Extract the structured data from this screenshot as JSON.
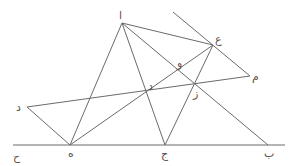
{
  "diagram": {
    "type": "geometric-figure",
    "colors": {
      "line": "#6b6b6b",
      "label": "#555555",
      "background": "#ffffff"
    },
    "points": [
      {
        "id": "alif",
        "label": "ا",
        "x": 122,
        "y": 23,
        "lx": 119,
        "ly": 19
      },
      {
        "id": "ayn",
        "label": "ع",
        "x": 213,
        "y": 45,
        "lx": 215,
        "ly": 43
      },
      {
        "id": "mim",
        "label": "م",
        "x": 250,
        "y": 76,
        "lx": 252,
        "ly": 80
      },
      {
        "id": "dal-left",
        "label": "د",
        "x": 27,
        "y": 107,
        "lx": 16,
        "ly": 111
      },
      {
        "id": "ha",
        "label": "ه",
        "x": 70,
        "y": 145,
        "lx": 68,
        "ly": 157
      },
      {
        "id": "jim",
        "label": "ج",
        "x": 165,
        "y": 145,
        "lx": 161,
        "ly": 158
      },
      {
        "id": "ba",
        "label": "ب",
        "x": 268,
        "y": 145,
        "lx": 264,
        "ly": 157
      },
      {
        "id": "ha-jim",
        "label": "ح",
        "x": 13,
        "y": 145,
        "lx": 13,
        "ly": 160
      },
      {
        "id": "dal-center",
        "label": "د",
        "x": 146,
        "y": 92,
        "lx": 148,
        "ly": 90
      },
      {
        "id": "waw",
        "label": "و",
        "x": 178,
        "y": 70,
        "lx": 177,
        "ly": 67
      },
      {
        "id": "zay",
        "label": "ز",
        "x": 196,
        "y": 84,
        "lx": 193,
        "ly": 97
      }
    ],
    "lines": [
      {
        "id": "baseline",
        "x1": 13,
        "y1": 145,
        "x2": 285,
        "y2": 145
      },
      {
        "id": "alif-ha",
        "x1": 122,
        "y1": 23,
        "x2": 70,
        "y2": 145
      },
      {
        "id": "alif-jim",
        "x1": 122,
        "y1": 23,
        "x2": 165,
        "y2": 145
      },
      {
        "id": "alif-ayn",
        "x1": 122,
        "y1": 23,
        "x2": 213,
        "y2": 45
      },
      {
        "id": "alif-ba",
        "x1": 122,
        "y1": 23,
        "x2": 268,
        "y2": 145
      },
      {
        "id": "top-mim",
        "x1": 173,
        "y1": 12,
        "x2": 250,
        "y2": 76
      },
      {
        "id": "dal-mim",
        "x1": 27,
        "y1": 107,
        "x2": 250,
        "y2": 76
      },
      {
        "id": "dal-ha",
        "x1": 27,
        "y1": 107,
        "x2": 70,
        "y2": 145
      },
      {
        "id": "ha-ayn",
        "x1": 70,
        "y1": 145,
        "x2": 213,
        "y2": 45
      },
      {
        "id": "jim-ayn",
        "x1": 165,
        "y1": 145,
        "x2": 213,
        "y2": 45
      }
    ]
  }
}
